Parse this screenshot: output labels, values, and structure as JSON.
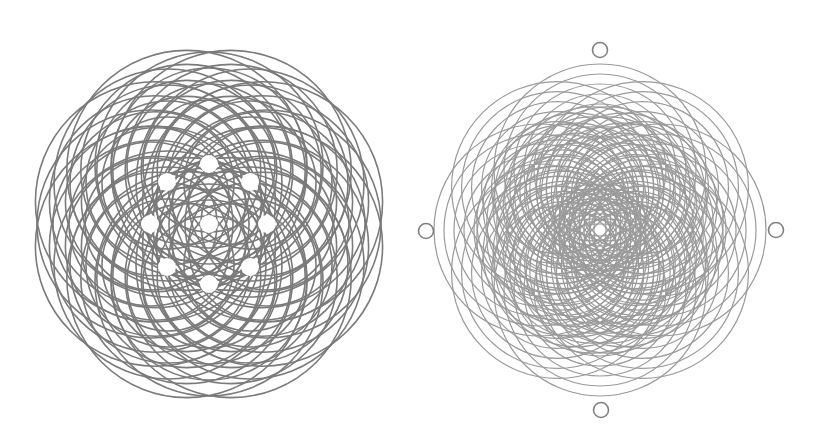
{
  "figures": [
    {
      "id": "left-rosette",
      "label": "circle-rosette-with-nine-holes",
      "center": [
        209,
        224
      ],
      "stroke": "#7a7a7a",
      "stroke_width": 1.6,
      "families": [
        {
          "ring_radius": 58,
          "count": 8,
          "start_angle_deg": -90,
          "radii": [
            66,
            82,
            98,
            114
          ]
        },
        {
          "ring_radius": 58,
          "count": 8,
          "start_angle_deg": -67.5,
          "radii": [
            74,
            90,
            106,
            120
          ]
        },
        {
          "ring_radius": 0,
          "count": 1,
          "start_angle_deg": 0,
          "radii": []
        }
      ],
      "holes": {
        "radius": 9,
        "fill": "#ffffff",
        "points": [
          [
            209,
            224
          ],
          [
            209,
            164
          ],
          [
            167,
            182
          ],
          [
            250,
            182
          ],
          [
            150,
            224
          ],
          [
            267,
            224
          ],
          [
            167,
            267
          ],
          [
            250,
            267
          ],
          [
            209,
            284
          ]
        ]
      },
      "markers": []
    },
    {
      "id": "right-rosette",
      "label": "eight-petal-circle-rosette",
      "center": [
        600,
        230
      ],
      "stroke": "#9a9a9a",
      "stroke_width": 1.2,
      "families": [
        {
          "ring_radius": 60,
          "count": 8,
          "start_angle_deg": -90,
          "radii": [
            66,
            76,
            86,
            96,
            106
          ]
        },
        {
          "ring_radius": 42,
          "count": 16,
          "start_angle_deg": -78.75,
          "radii": [
            52,
            62,
            72,
            82
          ]
        }
      ],
      "holes": {
        "radius": 0,
        "fill": "#ffffff",
        "points": []
      },
      "markers": [
        {
          "name": "top-marker",
          "cx": 600,
          "cy": 50,
          "r": 7.5
        },
        {
          "name": "bottom-marker",
          "cx": 601,
          "cy": 410,
          "r": 7.5
        },
        {
          "name": "left-marker",
          "cx": 426,
          "cy": 231,
          "r": 7.5
        },
        {
          "name": "right-marker",
          "cx": 776,
          "cy": 230,
          "r": 7.5
        }
      ],
      "marker_stroke": "#808080",
      "marker_stroke_width": 1.6
    }
  ]
}
